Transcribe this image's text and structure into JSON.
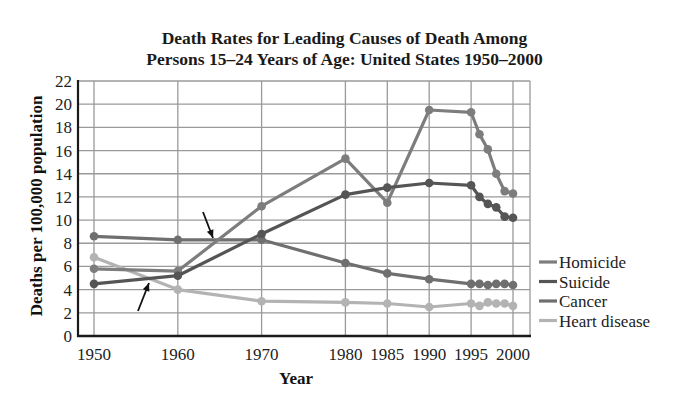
{
  "chart_data": {
    "type": "line",
    "title": "Death Rates for Leading Causes of Death Among Persons 15–24 Years of Age: United States 1950–2000",
    "title_lines": [
      "Death Rates for Leading Causes of Death Among",
      "Persons 15–24 Years of Age: United States 1950–2000"
    ],
    "xlabel": "Year",
    "ylabel": "Deaths per 100,000 population",
    "x_tick_labels": [
      "1950",
      "1960",
      "1970",
      "1980",
      "1985",
      "1990",
      "1995",
      "2000"
    ],
    "x_ticks": [
      1950,
      1960,
      1970,
      1980,
      1985,
      1990,
      1995,
      2000
    ],
    "y_ticks": [
      0,
      2,
      4,
      6,
      8,
      10,
      12,
      14,
      16,
      18,
      20,
      22
    ],
    "xlim": [
      1950,
      2000
    ],
    "ylim": [
      0,
      22
    ],
    "grid": true,
    "legend_position": "right",
    "series": [
      {
        "name": "Homicide",
        "color": "#7d7d7d",
        "x": [
          1950,
          1960,
          1970,
          1980,
          1985,
          1990,
          1995,
          1996,
          1997,
          1998,
          1999,
          2000
        ],
        "values": [
          5.8,
          5.6,
          11.2,
          15.3,
          11.5,
          19.5,
          19.3,
          17.4,
          16.1,
          14.0,
          12.5,
          12.3
        ]
      },
      {
        "name": "Suicide",
        "color": "#555555",
        "x": [
          1950,
          1960,
          1970,
          1980,
          1985,
          1990,
          1995,
          1996,
          1997,
          1998,
          1999,
          2000
        ],
        "values": [
          4.5,
          5.2,
          8.8,
          12.2,
          12.8,
          13.2,
          13.0,
          12.0,
          11.4,
          11.1,
          10.3,
          10.2
        ]
      },
      {
        "name": "Cancer",
        "color": "#6f6f6f",
        "x": [
          1950,
          1960,
          1970,
          1980,
          1985,
          1990,
          1995,
          1996,
          1997,
          1998,
          1999,
          2000
        ],
        "values": [
          8.6,
          8.3,
          8.3,
          6.3,
          5.4,
          4.9,
          4.5,
          4.5,
          4.4,
          4.5,
          4.5,
          4.4
        ]
      },
      {
        "name": "Heart disease",
        "color": "#b3b3b3",
        "x": [
          1950,
          1960,
          1970,
          1980,
          1985,
          1990,
          1995,
          1996,
          1997,
          1998,
          1999,
          2000
        ],
        "values": [
          6.8,
          4.0,
          3.0,
          2.9,
          2.8,
          2.5,
          2.8,
          2.6,
          2.9,
          2.8,
          2.8,
          2.6
        ]
      }
    ],
    "annotations": [
      {
        "type": "arrow",
        "points_to_year": 1964.5,
        "points_to_value": 8.3,
        "direction": "down-right",
        "note": "Homicide crosses Cancer"
      },
      {
        "type": "arrow",
        "points_to_year": 1957,
        "points_to_value": 5.0,
        "direction": "up-right",
        "note": "Heart disease crosses Suicide"
      }
    ]
  }
}
